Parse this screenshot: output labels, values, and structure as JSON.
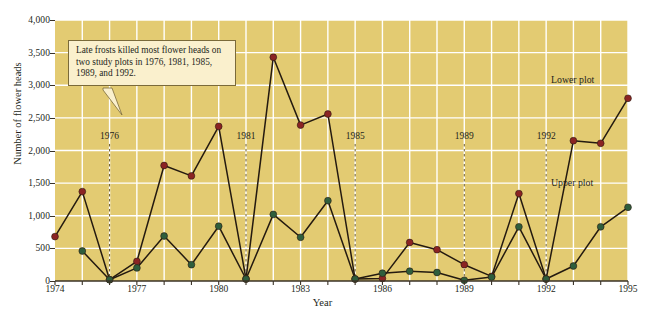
{
  "chart_data": {
    "type": "line",
    "title": "",
    "xlabel": "Year",
    "ylabel": "Number of flower heads",
    "xlim": [
      1974,
      1995
    ],
    "ylim": [
      0,
      4000
    ],
    "grid": true,
    "legend_position": "inline-right",
    "x": [
      1974,
      1975,
      1976,
      1977,
      1978,
      1979,
      1980,
      1981,
      1982,
      1983,
      1984,
      1985,
      1986,
      1987,
      1988,
      1989,
      1990,
      1991,
      1992,
      1993,
      1994,
      1995
    ],
    "xtick_labels": [
      "1974",
      "1977",
      "1980",
      "1983",
      "1986",
      "1989",
      "1992",
      "1995"
    ],
    "xtick_values": [
      1974,
      1977,
      1980,
      1983,
      1986,
      1989,
      1992,
      1995
    ],
    "ytick_labels": [
      "0",
      "500",
      "1,000",
      "1,500",
      "2,000",
      "2,500",
      "3,000",
      "3,500",
      "4,000"
    ],
    "ytick_values": [
      0,
      500,
      1000,
      1500,
      2000,
      2500,
      3000,
      3500,
      4000
    ],
    "series": [
      {
        "name": "Lower plot",
        "color": "#8b2423",
        "values": [
          680,
          1370,
          20,
          300,
          1770,
          1610,
          2370,
          30,
          3430,
          2390,
          2560,
          30,
          40,
          590,
          480,
          250,
          70,
          1340,
          30,
          2150,
          2110,
          2800
        ]
      },
      {
        "name": "Upper plot",
        "color": "#2f5e3c",
        "values": [
          null,
          460,
          20,
          200,
          690,
          250,
          840,
          30,
          1020,
          670,
          1230,
          30,
          120,
          150,
          130,
          10,
          60,
          830,
          30,
          230,
          830,
          1130
        ]
      }
    ],
    "annotations": [
      {
        "name": "frost-note",
        "text": "Late frosts killed most flower heads on two study plots in 1976, 1981, 1985, 1989, and 1992."
      }
    ],
    "frost_years": [
      {
        "label": "1976",
        "year": 1976
      },
      {
        "label": "1981",
        "year": 1981
      },
      {
        "label": "1985",
        "year": 1985
      },
      {
        "label": "1989",
        "year": 1989
      },
      {
        "label": "1992",
        "year": 1992
      }
    ],
    "colors": {
      "plot_background": "#e3cb72",
      "gridline": "#ffffff",
      "axis": "#3a3226",
      "line": "#241a10",
      "callout_background": "#faf0cd",
      "callout_border": "#7a6a3a",
      "lower_plot": "#8b2423",
      "upper_plot": "#2f5e3c"
    }
  }
}
